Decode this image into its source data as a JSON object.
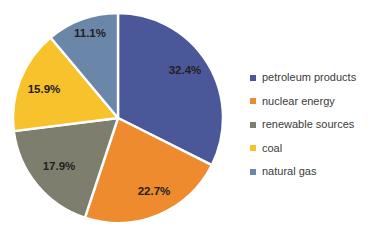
{
  "chart_data": {
    "type": "pie",
    "title": "",
    "subtitle": "",
    "xlabel": "",
    "ylabel": "",
    "grid": false,
    "legend_position": "right",
    "start_angle_deg": 0,
    "direction": "clockwise",
    "units": "percent",
    "total": "100.0%",
    "categories": [
      "petroleum products",
      "nuclear energy",
      "renewable sources",
      "coal",
      "natural gas"
    ],
    "values": [
      32.4,
      22.7,
      17.9,
      15.9,
      11.1
    ],
    "labels": [
      "32.4%",
      "22.7%",
      "17.9%",
      "15.9%",
      "11.1%"
    ],
    "colors": [
      "#4A5899",
      "#EE8B2E",
      "#7E7E6F",
      "#F7C22B",
      "#6A86A8"
    ],
    "slices": [
      {
        "name": "petroleum products",
        "value": 32.4,
        "label": "32.4%",
        "color": "#4A5899",
        "label_x": 185,
        "label_y": 71
      },
      {
        "name": "nuclear energy",
        "value": 22.7,
        "label": "22.7%",
        "color": "#EE8B2E",
        "label_x": 154,
        "label_y": 192
      },
      {
        "name": "renewable sources",
        "value": 17.9,
        "label": "17.9%",
        "color": "#7E7E6F",
        "label_x": 59,
        "label_y": 167
      },
      {
        "name": "coal",
        "value": 15.9,
        "label": "15.9%",
        "color": "#F7C22B",
        "label_x": 44,
        "label_y": 90
      },
      {
        "name": "natural gas",
        "value": 11.1,
        "label": "11.1%",
        "color": "#6A86A8",
        "label_x": 90,
        "label_y": 34
      }
    ],
    "geometry": {
      "center_x": 118,
      "center_y": 118,
      "radius": 105
    }
  },
  "legend": {
    "items": [
      {
        "label": "petroleum products",
        "color": "#4A5899"
      },
      {
        "label": "nuclear energy",
        "color": "#EE8B2E"
      },
      {
        "label": "renewable sources",
        "color": "#7E7E6F"
      },
      {
        "label": "coal",
        "color": "#F7C22B"
      },
      {
        "label": "natural gas",
        "color": "#6A86A8"
      }
    ]
  }
}
